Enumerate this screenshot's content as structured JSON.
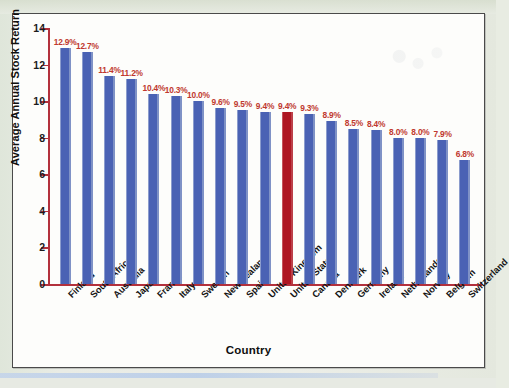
{
  "chart_data": {
    "type": "bar",
    "title": "",
    "xlabel": "Country",
    "ylabel": "Average Annual Stock Return",
    "ylim": [
      0,
      14
    ],
    "yticks": [
      0,
      2,
      4,
      6,
      8,
      10,
      12,
      14
    ],
    "grid": false,
    "legend": null,
    "categories": [
      "Finland",
      "South Africa",
      "Australia",
      "Japan",
      "France",
      "Italy",
      "Sweden",
      "New Zealand",
      "Spain",
      "United Kingdom",
      "United States",
      "Canada",
      "Denmark",
      "Germany",
      "Ireland",
      "Netherlands",
      "Norway",
      "Belgium",
      "Switzerland"
    ],
    "values": [
      12.9,
      12.7,
      11.4,
      11.2,
      10.4,
      10.3,
      10.0,
      9.6,
      9.5,
      9.4,
      9.4,
      9.3,
      8.9,
      8.5,
      8.4,
      8.0,
      8.0,
      7.9,
      6.8
    ],
    "data_labels": [
      "12.9%",
      "12.7%",
      "11.4%",
      "11.2%",
      "10.4%",
      "10.3%",
      "10.0%",
      "9.6%",
      "9.5%",
      "9.4%",
      "9.4%",
      "9.3%",
      "8.9%",
      "8.5%",
      "8.4%",
      "8.0%",
      "8.0%",
      "7.9%",
      "6.8%"
    ],
    "highlighted_category": "United States",
    "highlight_index": 10,
    "colors": {
      "bar": "#4a62b4",
      "bar_highlight": "#ae1622",
      "axis_line": "#b3313c",
      "data_label": "#c0392f",
      "axis_text": "#141414",
      "frame": "#4a4a4a",
      "plot_background": "#fdfdfb",
      "page_background": "#e8ece2"
    }
  }
}
